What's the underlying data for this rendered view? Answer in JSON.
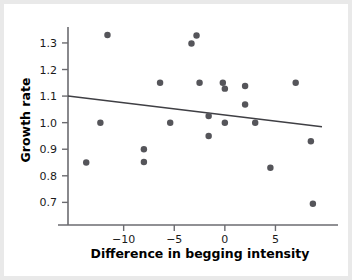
{
  "chart_data": {
    "type": "scatter",
    "title": "",
    "xlabel": "Difference in begging intensity",
    "ylabel": "Growth rate",
    "xlim": [
      -15.5,
      9.6
    ],
    "ylim": [
      0.66,
      1.36
    ],
    "xticks": [
      -10,
      -5,
      0,
      5
    ],
    "xtick_labels": [
      "−10",
      "−5",
      "0",
      "5"
    ],
    "yticks": [
      0.7,
      0.8,
      0.9,
      1.0,
      1.1,
      1.2,
      1.3
    ],
    "ytick_labels": [
      "0.7",
      "0.8",
      "0.9",
      "1.0",
      "1.1",
      "1.2",
      "1.3"
    ],
    "grid": false,
    "legend": null,
    "point_color": "#55555a",
    "point_size": 5,
    "line_color": "#3f3f44",
    "axis_color": "#6b6b70",
    "points": [
      {
        "x": -13.7,
        "y": 0.85
      },
      {
        "x": -12.3,
        "y": 1.0
      },
      {
        "x": -11.6,
        "y": 1.33
      },
      {
        "x": -8.0,
        "y": 0.9
      },
      {
        "x": -8.0,
        "y": 0.852
      },
      {
        "x": -6.4,
        "y": 1.15
      },
      {
        "x": -5.4,
        "y": 1.0
      },
      {
        "x": -3.3,
        "y": 1.298
      },
      {
        "x": -2.8,
        "y": 1.328
      },
      {
        "x": -2.5,
        "y": 1.15
      },
      {
        "x": -1.6,
        "y": 1.025
      },
      {
        "x": -1.6,
        "y": 0.95
      },
      {
        "x": -0.2,
        "y": 1.15
      },
      {
        "x": 0.0,
        "y": 1.128
      },
      {
        "x": 0.0,
        "y": 1.0
      },
      {
        "x": 2.0,
        "y": 1.138
      },
      {
        "x": 2.0,
        "y": 1.068
      },
      {
        "x": 3.0,
        "y": 1.0
      },
      {
        "x": 4.5,
        "y": 0.83
      },
      {
        "x": 7.0,
        "y": 1.15
      },
      {
        "x": 8.5,
        "y": 0.93
      },
      {
        "x": 8.7,
        "y": 0.695
      }
    ],
    "trendline": {
      "label": "least-squares regression line",
      "x_start": -15.5,
      "y_start": 1.1,
      "x_end": 9.6,
      "y_end": 0.985
    }
  }
}
